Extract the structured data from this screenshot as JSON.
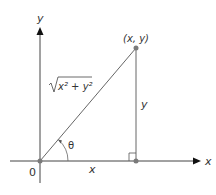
{
  "diagram": {
    "axes": {
      "x_label": "x",
      "y_label": "y",
      "origin_label": "0"
    },
    "point": {
      "label": "(x, y)"
    },
    "segments": {
      "hypotenuse_label_radicand": "x² + y²",
      "vertical_label": "y",
      "horizontal_label": "x"
    },
    "angle": {
      "label": "θ"
    },
    "colors": {
      "line": "#555555",
      "axis": "#333333",
      "point": "#7a7a7a",
      "text": "#333333"
    }
  }
}
